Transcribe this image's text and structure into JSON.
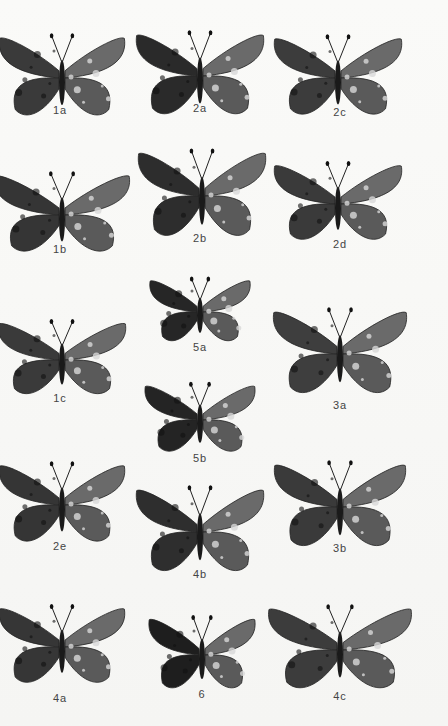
{
  "plate": {
    "background": "#f7f7f5",
    "specimens": [
      {
        "id": "1a",
        "cx": 62,
        "cy": 78,
        "w": 130,
        "h": 90,
        "shade": "#3a3a3a",
        "label_y": 112,
        "label_x": 60
      },
      {
        "id": "2a",
        "cx": 200,
        "cy": 76,
        "w": 132,
        "h": 92,
        "shade": "#2a2a2a",
        "label_y": 110,
        "label_x": 200
      },
      {
        "id": "2c",
        "cx": 338,
        "cy": 78,
        "w": 132,
        "h": 88,
        "shade": "#3c3c3c",
        "label_y": 114,
        "label_x": 340
      },
      {
        "id": "1b",
        "cx": 62,
        "cy": 215,
        "w": 140,
        "h": 88,
        "shade": "#353535",
        "label_y": 251,
        "label_x": 60
      },
      {
        "id": "2b",
        "cx": 202,
        "cy": 196,
        "w": 132,
        "h": 96,
        "shade": "#2d2d2d",
        "label_y": 240,
        "label_x": 200
      },
      {
        "id": "2d",
        "cx": 338,
        "cy": 204,
        "w": 132,
        "h": 86,
        "shade": "#3a3a3a",
        "label_y": 246,
        "label_x": 340
      },
      {
        "id": "5a",
        "cx": 200,
        "cy": 312,
        "w": 104,
        "h": 70,
        "shade": "#262626",
        "label_y": 349,
        "label_x": 200
      },
      {
        "id": "1c",
        "cx": 62,
        "cy": 360,
        "w": 132,
        "h": 82,
        "shade": "#3a3a3a",
        "label_y": 400,
        "label_x": 60
      },
      {
        "id": "3a",
        "cx": 340,
        "cy": 354,
        "w": 138,
        "h": 94,
        "shade": "#3e3e3e",
        "label_y": 407,
        "label_x": 340
      },
      {
        "id": "5b",
        "cx": 200,
        "cy": 420,
        "w": 114,
        "h": 76,
        "shade": "#242424",
        "label_y": 460,
        "label_x": 200
      },
      {
        "id": "2e",
        "cx": 62,
        "cy": 505,
        "w": 130,
        "h": 88,
        "shade": "#353535",
        "label_y": 548,
        "label_x": 60
      },
      {
        "id": "4b",
        "cx": 200,
        "cy": 532,
        "w": 132,
        "h": 94,
        "shade": "#2e2e2e",
        "label_y": 576,
        "label_x": 200
      },
      {
        "id": "3b",
        "cx": 340,
        "cy": 507,
        "w": 136,
        "h": 94,
        "shade": "#3a3a3a",
        "label_y": 550,
        "label_x": 340
      },
      {
        "id": "4a",
        "cx": 62,
        "cy": 647,
        "w": 130,
        "h": 86,
        "shade": "#363636",
        "label_y": 700,
        "label_x": 60
      },
      {
        "id": "6",
        "cx": 202,
        "cy": 655,
        "w": 110,
        "h": 80,
        "shade": "#1e1e1e",
        "label_y": 696,
        "label_x": 202
      },
      {
        "id": "4c",
        "cx": 340,
        "cy": 650,
        "w": 148,
        "h": 92,
        "shade": "#3c3c3c",
        "label_y": 698,
        "label_x": 340
      }
    ]
  }
}
